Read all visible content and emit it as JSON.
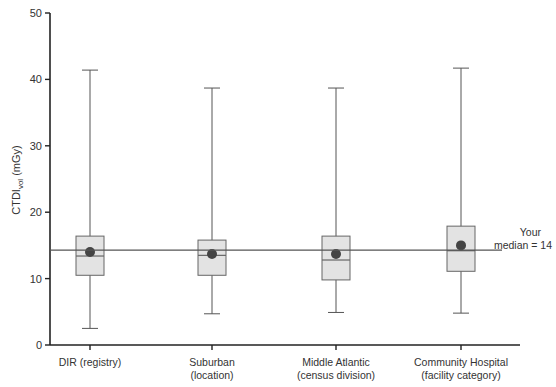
{
  "chart_data": {
    "type": "box",
    "title": "",
    "xlabel": "",
    "ylabel": "CTDIvol (mGy)",
    "ylabel_main": "CTDI",
    "ylabel_sub": "vol",
    "ylabel_unit": " (mGy)",
    "ylim": [
      0,
      50
    ],
    "yticks": [
      0,
      10,
      20,
      30,
      40,
      50
    ],
    "grid": false,
    "categories": [
      {
        "line1": "DIR (registry)",
        "line2": ""
      },
      {
        "line1": "Suburban",
        "line2": "(location)"
      },
      {
        "line1": "Middle Atlantic",
        "line2": "(census division)"
      },
      {
        "line1": "Community Hospital",
        "line2": "(facility category)"
      }
    ],
    "series": [
      {
        "name": "DIR (registry)",
        "whisker_low": 2.5,
        "q1": 10.5,
        "median": 13.4,
        "q3": 16.4,
        "whisker_high": 41.4,
        "mean": 14.0
      },
      {
        "name": "Suburban (location)",
        "whisker_low": 4.7,
        "q1": 10.5,
        "median": 13.5,
        "q3": 15.8,
        "whisker_high": 38.7,
        "mean": 13.7
      },
      {
        "name": "Middle Atlantic (census division)",
        "whisker_low": 4.9,
        "q1": 9.8,
        "median": 12.8,
        "q3": 16.4,
        "whisker_high": 38.7,
        "mean": 13.7
      },
      {
        "name": "Community Hospital (facility category)",
        "whisker_low": 4.8,
        "q1": 11.1,
        "median": 14.2,
        "q3": 17.9,
        "whisker_high": 41.7,
        "mean": 15.0
      }
    ],
    "reference_line": {
      "value": 14,
      "label_line1": "Your",
      "label_line2": "median = 14"
    }
  },
  "colors": {
    "axis": "#222222",
    "whisker": "#555555",
    "box_fill": "#e3e3e3",
    "box_stroke": "#666666",
    "mean_dot": "#444444",
    "reference": "#555555",
    "text": "#333333"
  }
}
